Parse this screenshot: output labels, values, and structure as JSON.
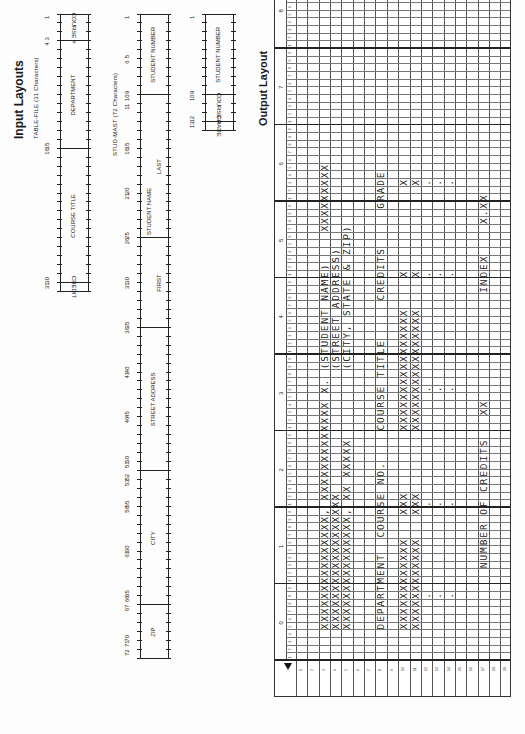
{
  "input_layouts": {
    "title": "Input Layouts",
    "table_file": {
      "caption": "TABLE-FILE (31 Characters)",
      "position_numbers": [
        "1",
        "3",
        "4",
        "15",
        "16",
        "30",
        "31"
      ],
      "fields": [
        {
          "label": "COURSE #",
          "from": 1,
          "to": 3
        },
        {
          "label": "DEPARTMENT",
          "from": 4,
          "to": 15
        },
        {
          "label": "COURSE TITLE",
          "from": 16,
          "to": 30
        },
        {
          "label": "CREDIT",
          "from": 31,
          "to": 31
        }
      ]
    },
    "stud_mast": {
      "caption": "STUD-MAST (72 Characters)",
      "position_numbers": [
        "1",
        "5",
        "6",
        "9",
        "10",
        "11",
        "15",
        "16",
        "20",
        "21",
        "25",
        "26",
        "30",
        "31",
        "35",
        "36",
        "40",
        "41",
        "45",
        "46",
        "50",
        "51",
        "52",
        "53",
        "55",
        "56",
        "60",
        "61",
        "65",
        "66",
        "67",
        "70",
        "71",
        "72"
      ],
      "fields": [
        {
          "label": "STUDENT NUMBER",
          "from": 1,
          "to": 9
        },
        {
          "label": "STUDENT NAME",
          "from": 10,
          "to": 35
        },
        {
          "label": "LAST",
          "from": 10,
          "to": 25
        },
        {
          "label": "FIRST",
          "from": 26,
          "to": 35
        },
        {
          "label": "STREET ADDRESS",
          "from": 36,
          "to": 51
        },
        {
          "label": "CITY",
          "from": 52,
          "to": 66
        },
        {
          "label": "ZIP",
          "from": 67,
          "to": 72
        }
      ]
    },
    "grade_file": {
      "position_numbers": [
        "1",
        "9",
        "10",
        "12",
        "13"
      ],
      "fields": [
        {
          "label": "STUDENT NUMBER",
          "from": 1,
          "to": 9
        },
        {
          "label": "COURSE #",
          "from": 10,
          "to": 12
        },
        {
          "label": "GRADE",
          "from": 13,
          "to": 13
        }
      ]
    }
  },
  "output_layout": {
    "title": "Output Layout",
    "tens_labels": [
      "0",
      "1",
      "2",
      "3",
      "4",
      "5",
      "6",
      "7",
      "8"
    ],
    "unit_labels": [
      "1",
      "2",
      "3",
      "4",
      "5",
      "6",
      "7",
      "8",
      "9",
      "0"
    ],
    "row_count": 19,
    "lines": [
      {
        "row": 3,
        "col": 5,
        "text": "XXXXXXXXXXXXXXX, XXXXXXXXXXXXX X."
      },
      {
        "row": 3,
        "col": 39,
        "text": "(STUDENT NAME)"
      },
      {
        "row": 3,
        "col": 57,
        "text": "XXXXXXXXX"
      },
      {
        "row": 4,
        "col": 5,
        "text": "XXXXXXXXXXXXXXXXXX"
      },
      {
        "row": 4,
        "col": 39,
        "text": "(STREET ADDRESS)"
      },
      {
        "row": 5,
        "col": 5,
        "text": "XXXXXXXXXXXXXXX, XX XXXXX"
      },
      {
        "row": 5,
        "col": 39,
        "text": "(CITY, STATE & ZIP)"
      },
      {
        "row": 8,
        "col": 5,
        "text": "DEPARTMENT"
      },
      {
        "row": 8,
        "col": 17,
        "text": "COURSE NO."
      },
      {
        "row": 8,
        "col": 31,
        "text": "COURSE TITLE"
      },
      {
        "row": 8,
        "col": 48,
        "text": "CREDITS"
      },
      {
        "row": 8,
        "col": 60,
        "text": "GRADE"
      },
      {
        "row": 10,
        "col": 5,
        "text": "XXXXXXXXXXXX"
      },
      {
        "row": 10,
        "col": 20,
        "text": "XXX"
      },
      {
        "row": 10,
        "col": 31,
        "text": "XXXXXXXXXXXXXXXX"
      },
      {
        "row": 10,
        "col": 51,
        "text": "X"
      },
      {
        "row": 10,
        "col": 63,
        "text": "X"
      },
      {
        "row": 11,
        "col": 5,
        "text": "XXXXXXXXXXXX"
      },
      {
        "row": 11,
        "col": 20,
        "text": "XXX"
      },
      {
        "row": 11,
        "col": 31,
        "text": "XXXXXXXXXXXXXXXX"
      },
      {
        "row": 11,
        "col": 51,
        "text": "X"
      },
      {
        "row": 11,
        "col": 63,
        "text": "X"
      },
      {
        "row": 12,
        "col": 9,
        "text": "."
      },
      {
        "row": 12,
        "col": 21,
        "text": "."
      },
      {
        "row": 12,
        "col": 36,
        "text": "."
      },
      {
        "row": 12,
        "col": 51,
        "text": "."
      },
      {
        "row": 12,
        "col": 63,
        "text": "."
      },
      {
        "row": 13,
        "col": 9,
        "text": "."
      },
      {
        "row": 13,
        "col": 21,
        "text": "."
      },
      {
        "row": 13,
        "col": 36,
        "text": "."
      },
      {
        "row": 13,
        "col": 51,
        "text": "."
      },
      {
        "row": 13,
        "col": 63,
        "text": "."
      },
      {
        "row": 14,
        "col": 9,
        "text": "."
      },
      {
        "row": 14,
        "col": 21,
        "text": "."
      },
      {
        "row": 14,
        "col": 36,
        "text": "."
      },
      {
        "row": 14,
        "col": 51,
        "text": "."
      },
      {
        "row": 14,
        "col": 63,
        "text": "."
      },
      {
        "row": 17,
        "col": 13,
        "text": "NUMBER OF CREDITS"
      },
      {
        "row": 17,
        "col": 33,
        "text": "XX"
      },
      {
        "row": 17,
        "col": 49,
        "text": "INDEX"
      },
      {
        "row": 17,
        "col": 58,
        "text": "X.XX"
      }
    ]
  }
}
